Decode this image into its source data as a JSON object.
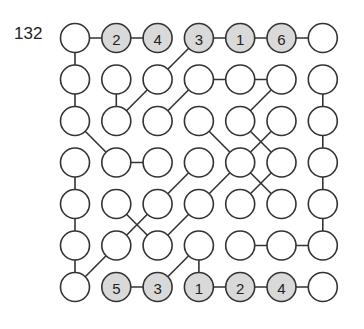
{
  "puzzle_number": "132",
  "grid": {
    "rows": 7,
    "cols": 7,
    "origin_x": 75,
    "origin_y": 38,
    "spacing_x": 41.3,
    "spacing_y": 41.5,
    "radius": 14.5
  },
  "colors": {
    "empty_fill": "#ffffff",
    "clue_fill": "#d9d9d9",
    "stroke": "#333333"
  },
  "clues": [
    {
      "r": 0,
      "c": 1,
      "value": "2"
    },
    {
      "r": 0,
      "c": 2,
      "value": "4"
    },
    {
      "r": 0,
      "c": 3,
      "value": "3"
    },
    {
      "r": 0,
      "c": 4,
      "value": "1"
    },
    {
      "r": 0,
      "c": 5,
      "value": "6"
    },
    {
      "r": 6,
      "c": 1,
      "value": "5"
    },
    {
      "r": 6,
      "c": 2,
      "value": "3"
    },
    {
      "r": 6,
      "c": 3,
      "value": "1"
    },
    {
      "r": 6,
      "c": 4,
      "value": "2"
    },
    {
      "r": 6,
      "c": 5,
      "value": "4"
    }
  ],
  "edges": [
    [
      0,
      0,
      0,
      1
    ],
    [
      0,
      1,
      0,
      2
    ],
    [
      0,
      3,
      0,
      4
    ],
    [
      0,
      4,
      0,
      5
    ],
    [
      0,
      5,
      0,
      6
    ],
    [
      0,
      0,
      1,
      0
    ],
    [
      1,
      0,
      2,
      0
    ],
    [
      0,
      3,
      1,
      2
    ],
    [
      1,
      1,
      2,
      1
    ],
    [
      1,
      2,
      2,
      1
    ],
    [
      1,
      3,
      1,
      4
    ],
    [
      1,
      4,
      1,
      5
    ],
    [
      1,
      3,
      2,
      2
    ],
    [
      1,
      5,
      2,
      4
    ],
    [
      1,
      6,
      2,
      6
    ],
    [
      2,
      6,
      3,
      6
    ],
    [
      2,
      0,
      3,
      1
    ],
    [
      3,
      1,
      3,
      2
    ],
    [
      2,
      3,
      3,
      4
    ],
    [
      2,
      4,
      3,
      5
    ],
    [
      2,
      5,
      3,
      4
    ],
    [
      3,
      0,
      4,
      0
    ],
    [
      4,
      0,
      5,
      0
    ],
    [
      5,
      0,
      6,
      0
    ],
    [
      3,
      6,
      4,
      6
    ],
    [
      4,
      6,
      5,
      6
    ],
    [
      3,
      3,
      4,
      2
    ],
    [
      3,
      4,
      4,
      3
    ],
    [
      3,
      4,
      4,
      5
    ],
    [
      3,
      5,
      4,
      4
    ],
    [
      4,
      1,
      5,
      2
    ],
    [
      4,
      2,
      5,
      1
    ],
    [
      4,
      3,
      5,
      2
    ],
    [
      5,
      1,
      6,
      0
    ],
    [
      5,
      4,
      5,
      5
    ],
    [
      5,
      5,
      5,
      6
    ],
    [
      5,
      3,
      6,
      2
    ],
    [
      5,
      3,
      6,
      3
    ],
    [
      6,
      1,
      6,
      2
    ],
    [
      6,
      3,
      6,
      4
    ],
    [
      6,
      4,
      6,
      5
    ],
    [
      6,
      5,
      6,
      6
    ]
  ]
}
